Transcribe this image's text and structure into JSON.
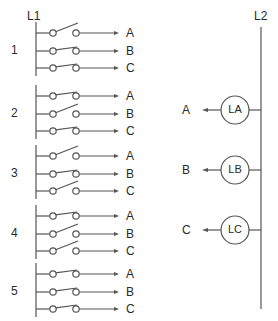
{
  "diagram": {
    "left_bus_label": "L1",
    "right_bus_label": "L2",
    "stroke_color": "#555555",
    "groups": [
      {
        "number": "1",
        "switches": [
          {
            "output": "A",
            "state": "open"
          },
          {
            "output": "B",
            "state": "closed"
          },
          {
            "output": "C",
            "state": "closed"
          }
        ]
      },
      {
        "number": "2",
        "switches": [
          {
            "output": "A",
            "state": "closed"
          },
          {
            "output": "B",
            "state": "open"
          },
          {
            "output": "C",
            "state": "closed"
          }
        ]
      },
      {
        "number": "3",
        "switches": [
          {
            "output": "A",
            "state": "open"
          },
          {
            "output": "B",
            "state": "closed"
          },
          {
            "output": "C",
            "state": "open"
          }
        ]
      },
      {
        "number": "4",
        "switches": [
          {
            "output": "A",
            "state": "closed"
          },
          {
            "output": "B",
            "state": "open"
          },
          {
            "output": "C",
            "state": "open"
          }
        ]
      },
      {
        "number": "5",
        "switches": [
          {
            "output": "A",
            "state": "closed"
          },
          {
            "output": "B",
            "state": "closed"
          },
          {
            "output": "C",
            "state": "closed"
          }
        ]
      }
    ],
    "lamps": [
      {
        "label": "LA",
        "input": "A"
      },
      {
        "label": "LB",
        "input": "B"
      },
      {
        "label": "LC",
        "input": "C"
      }
    ]
  }
}
